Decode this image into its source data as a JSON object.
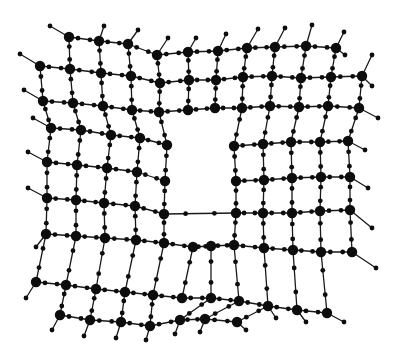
{
  "diagram": {
    "title": "2D framework lattice with central vacancy",
    "style": {
      "node_color": "#0d0d0d",
      "bond_color": "#1a1a1a",
      "background": "#ffffff",
      "hub_radius": 5.2,
      "linker_radius": 2.4
    },
    "vacancy": {
      "x": 168,
      "y": 145,
      "width": 66,
      "height": 68
    },
    "hubs": [
      [
        69,
        37
      ],
      [
        99,
        41
      ],
      [
        128,
        44
      ],
      [
        157,
        55
      ],
      [
        188,
        52
      ],
      [
        218,
        51
      ],
      [
        247,
        48
      ],
      [
        275,
        47
      ],
      [
        306,
        46
      ],
      [
        336,
        48
      ],
      [
        40,
        66
      ],
      [
        70,
        69
      ],
      [
        101,
        73
      ],
      [
        131,
        76
      ],
      [
        160,
        83
      ],
      [
        189,
        80
      ],
      [
        216,
        80
      ],
      [
        243,
        77
      ],
      [
        272,
        76
      ],
      [
        301,
        78
      ],
      [
        331,
        77
      ],
      [
        362,
        76
      ],
      [
        43,
        101
      ],
      [
        73,
        103
      ],
      [
        103,
        106
      ],
      [
        132,
        110
      ],
      [
        159,
        112
      ],
      [
        188,
        110
      ],
      [
        215,
        108
      ],
      [
        242,
        108
      ],
      [
        270,
        106
      ],
      [
        299,
        107
      ],
      [
        328,
        106
      ],
      [
        359,
        108
      ],
      [
        51,
        128
      ],
      [
        81,
        130
      ],
      [
        111,
        135
      ],
      [
        140,
        138
      ],
      [
        167,
        145
      ],
      [
        234,
        146
      ],
      [
        263,
        144
      ],
      [
        291,
        142
      ],
      [
        320,
        142
      ],
      [
        348,
        141
      ],
      [
        47,
        162
      ],
      [
        77,
        165
      ],
      [
        107,
        168
      ],
      [
        137,
        172
      ],
      [
        165,
        181
      ],
      [
        236,
        181
      ],
      [
        264,
        180
      ],
      [
        292,
        178
      ],
      [
        321,
        177
      ],
      [
        350,
        177
      ],
      [
        47,
        198
      ],
      [
        76,
        200
      ],
      [
        104,
        203
      ],
      [
        135,
        206
      ],
      [
        164,
        214
      ],
      [
        236,
        213
      ],
      [
        263,
        213
      ],
      [
        292,
        213
      ],
      [
        320,
        211
      ],
      [
        350,
        210
      ],
      [
        46,
        234
      ],
      [
        76,
        236
      ],
      [
        105,
        238
      ],
      [
        136,
        240
      ],
      [
        164,
        243
      ],
      [
        193,
        247
      ],
      [
        211,
        246
      ],
      [
        234,
        245
      ],
      [
        264,
        248
      ],
      [
        293,
        250
      ],
      [
        321,
        252
      ],
      [
        352,
        252
      ],
      [
        36,
        282
      ],
      [
        66,
        285
      ],
      [
        96,
        289
      ],
      [
        125,
        292
      ],
      [
        153,
        295
      ],
      [
        182,
        298
      ],
      [
        211,
        298
      ],
      [
        239,
        301
      ],
      [
        268,
        306
      ],
      [
        297,
        310
      ],
      [
        327,
        313
      ],
      [
        60,
        315
      ],
      [
        90,
        320
      ],
      [
        121,
        322
      ],
      [
        150,
        326
      ],
      [
        180,
        320
      ],
      [
        205,
        319
      ],
      [
        237,
        322
      ]
    ],
    "edges": [
      [
        0,
        1
      ],
      [
        1,
        2
      ],
      [
        2,
        3
      ],
      [
        3,
        4
      ],
      [
        4,
        5
      ],
      [
        5,
        6
      ],
      [
        6,
        7
      ],
      [
        7,
        8
      ],
      [
        8,
        9
      ],
      [
        10,
        11
      ],
      [
        11,
        12
      ],
      [
        12,
        13
      ],
      [
        13,
        14
      ],
      [
        14,
        15
      ],
      [
        15,
        16
      ],
      [
        16,
        17
      ],
      [
        17,
        18
      ],
      [
        18,
        19
      ],
      [
        19,
        20
      ],
      [
        20,
        21
      ],
      [
        22,
        23
      ],
      [
        23,
        24
      ],
      [
        24,
        25
      ],
      [
        25,
        26
      ],
      [
        26,
        27
      ],
      [
        27,
        28
      ],
      [
        28,
        29
      ],
      [
        29,
        30
      ],
      [
        30,
        31
      ],
      [
        31,
        32
      ],
      [
        32,
        33
      ],
      [
        34,
        35
      ],
      [
        35,
        36
      ],
      [
        36,
        37
      ],
      [
        37,
        38
      ],
      [
        39,
        40
      ],
      [
        40,
        41
      ],
      [
        41,
        42
      ],
      [
        42,
        43
      ],
      [
        44,
        45
      ],
      [
        45,
        46
      ],
      [
        46,
        47
      ],
      [
        47,
        48
      ],
      [
        49,
        50
      ],
      [
        50,
        51
      ],
      [
        51,
        52
      ],
      [
        52,
        53
      ],
      [
        54,
        55
      ],
      [
        55,
        56
      ],
      [
        56,
        57
      ],
      [
        57,
        58
      ],
      [
        59,
        60
      ],
      [
        60,
        61
      ],
      [
        61,
        62
      ],
      [
        62,
        63
      ],
      [
        64,
        65
      ],
      [
        65,
        66
      ],
      [
        66,
        67
      ],
      [
        67,
        68
      ],
      [
        68,
        69
      ],
      [
        69,
        70
      ],
      [
        70,
        71
      ],
      [
        71,
        72
      ],
      [
        72,
        73
      ],
      [
        73,
        74
      ],
      [
        74,
        75
      ],
      [
        76,
        77
      ],
      [
        77,
        78
      ],
      [
        78,
        79
      ],
      [
        79,
        80
      ],
      [
        80,
        81
      ],
      [
        81,
        82
      ],
      [
        82,
        83
      ],
      [
        83,
        84
      ],
      [
        84,
        85
      ],
      [
        85,
        86
      ],
      [
        87,
        88
      ],
      [
        88,
        89
      ],
      [
        89,
        90
      ],
      [
        90,
        91
      ],
      [
        91,
        92
      ],
      [
        92,
        93
      ],
      [
        0,
        11
      ],
      [
        1,
        12
      ],
      [
        2,
        13
      ],
      [
        3,
        14
      ],
      [
        4,
        15
      ],
      [
        5,
        16
      ],
      [
        6,
        17
      ],
      [
        7,
        18
      ],
      [
        8,
        19
      ],
      [
        9,
        20
      ],
      [
        10,
        22
      ],
      [
        11,
        23
      ],
      [
        12,
        24
      ],
      [
        13,
        25
      ],
      [
        14,
        26
      ],
      [
        15,
        27
      ],
      [
        16,
        28
      ],
      [
        17,
        29
      ],
      [
        18,
        30
      ],
      [
        19,
        31
      ],
      [
        20,
        32
      ],
      [
        21,
        33
      ],
      [
        22,
        34
      ],
      [
        23,
        35
      ],
      [
        24,
        36
      ],
      [
        25,
        37
      ],
      [
        26,
        38
      ],
      [
        29,
        39
      ],
      [
        30,
        40
      ],
      [
        31,
        41
      ],
      [
        32,
        42
      ],
      [
        33,
        43
      ],
      [
        34,
        44
      ],
      [
        35,
        45
      ],
      [
        36,
        46
      ],
      [
        37,
        47
      ],
      [
        38,
        48
      ],
      [
        39,
        49
      ],
      [
        40,
        50
      ],
      [
        41,
        51
      ],
      [
        42,
        52
      ],
      [
        43,
        53
      ],
      [
        44,
        54
      ],
      [
        45,
        55
      ],
      [
        46,
        56
      ],
      [
        47,
        57
      ],
      [
        48,
        58
      ],
      [
        49,
        59
      ],
      [
        50,
        60
      ],
      [
        51,
        61
      ],
      [
        52,
        62
      ],
      [
        53,
        63
      ],
      [
        54,
        64
      ],
      [
        55,
        65
      ],
      [
        56,
        66
      ],
      [
        57,
        67
      ],
      [
        58,
        68
      ],
      [
        59,
        71
      ],
      [
        60,
        72
      ],
      [
        61,
        73
      ],
      [
        62,
        74
      ],
      [
        63,
        75
      ],
      [
        64,
        76
      ],
      [
        65,
        77
      ],
      [
        66,
        78
      ],
      [
        67,
        79
      ],
      [
        68,
        80
      ],
      [
        69,
        81
      ],
      [
        70,
        82
      ],
      [
        71,
        83
      ],
      [
        72,
        84
      ],
      [
        73,
        85
      ],
      [
        74,
        86
      ],
      [
        77,
        87
      ],
      [
        78,
        88
      ],
      [
        79,
        89
      ],
      [
        80,
        90
      ],
      [
        82,
        91
      ],
      [
        83,
        92
      ],
      [
        84,
        93
      ],
      [
        26,
        27
      ],
      [
        27,
        28
      ],
      [
        58,
        59
      ]
    ],
    "stubs": [
      [
        69,
        37,
        50,
        26
      ],
      [
        99,
        41,
        104,
        26
      ],
      [
        128,
        44,
        138,
        30
      ],
      [
        157,
        55,
        168,
        38
      ],
      [
        188,
        52,
        196,
        38
      ],
      [
        218,
        51,
        226,
        34
      ],
      [
        247,
        48,
        258,
        29
      ],
      [
        275,
        47,
        285,
        28
      ],
      [
        306,
        46,
        312,
        25
      ],
      [
        336,
        48,
        344,
        32
      ],
      [
        362,
        76,
        372,
        55
      ],
      [
        40,
        66,
        20,
        54
      ],
      [
        43,
        101,
        24,
        90
      ],
      [
        51,
        128,
        33,
        118
      ],
      [
        47,
        162,
        28,
        152
      ],
      [
        47,
        198,
        28,
        188
      ],
      [
        46,
        234,
        36,
        247
      ],
      [
        36,
        282,
        26,
        298
      ],
      [
        60,
        315,
        52,
        330
      ],
      [
        90,
        320,
        84,
        336
      ],
      [
        121,
        322,
        116,
        338
      ],
      [
        150,
        326,
        146,
        340
      ],
      [
        180,
        320,
        175,
        334
      ],
      [
        205,
        319,
        200,
        332
      ],
      [
        237,
        322,
        246,
        330
      ],
      [
        268,
        306,
        276,
        318
      ],
      [
        297,
        310,
        306,
        322
      ],
      [
        327,
        313,
        344,
        322
      ],
      [
        352,
        252,
        376,
        268
      ],
      [
        350,
        210,
        372,
        228
      ],
      [
        350,
        177,
        368,
        188
      ],
      [
        348,
        141,
        365,
        150
      ],
      [
        359,
        108,
        378,
        118
      ],
      [
        336,
        48,
        345,
        55
      ],
      [
        362,
        76,
        372,
        86
      ]
    ]
  }
}
